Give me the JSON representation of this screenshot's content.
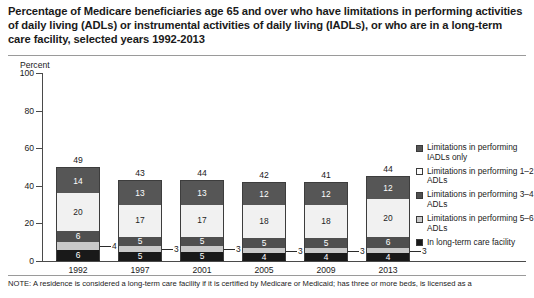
{
  "title": "Percentage of Medicare beneficiaries age 65 and over who have limitations in performing activities of daily living (ADLs) or instrumental activities of daily living (IADLs), or who are in a long-term care facility, selected years 1992-2013",
  "axis_title": "Percent",
  "note": "NOTE: A residence is considered a long-term care facility if it is certified by Medicare or Medicaid; has three or more beds, is licensed as a",
  "legend": {
    "items": [
      {
        "label": "Limitations in performing IADLs only",
        "swatch": "sw-iadl",
        "color": "#565656"
      },
      {
        "label": "Limitations in performing 1–2 ADLs",
        "swatch": "sw-adl12",
        "color": "#fbfbfb"
      },
      {
        "label": "Limitations in performing 3–4 ADLs",
        "swatch": "sw-adl34",
        "color": "#4f4f4f"
      },
      {
        "label": "Limitations in performing 5–6 ADLs",
        "swatch": "sw-adl56",
        "color": "#c9c9c9"
      },
      {
        "label": "In long-term care facility",
        "swatch": "sw-ltc",
        "color": "#191919"
      }
    ]
  },
  "chart_data": {
    "type": "bar",
    "subtype": "stacked-vertical",
    "title": "Percentage of Medicare beneficiaries age 65 and over who have limitations in performing activities of daily living (ADLs) or instrumental activities of daily living (IADLs), or who are in a long-term care facility, selected years 1992-2013",
    "xlabel": "",
    "ylabel": "Percent",
    "ylim": [
      0,
      100
    ],
    "yticks": [
      0,
      20,
      40,
      60,
      80,
      100
    ],
    "grid": false,
    "legend_position": "right",
    "categories": [
      "1992",
      "1997",
      "2001",
      "2005",
      "2009",
      "2013"
    ],
    "totals": [
      49,
      43,
      44,
      42,
      41,
      44
    ],
    "series": [
      {
        "name": "In long-term care facility",
        "color": "#191919",
        "values": [
          6,
          5,
          5,
          4,
          4,
          4
        ]
      },
      {
        "name": "Limitations in performing 5–6 ADLs",
        "color": "#c9c9c9",
        "values": [
          4,
          3,
          3,
          3,
          3,
          3
        ]
      },
      {
        "name": "Limitations in performing 3–4 ADLs",
        "color": "#4f4f4f",
        "values": [
          6,
          5,
          5,
          5,
          5,
          6
        ]
      },
      {
        "name": "Limitations in performing 1–2 ADLs",
        "color": "#f1f1f1",
        "values": [
          20,
          17,
          17,
          18,
          18,
          20
        ]
      },
      {
        "name": "Limitations in performing IADLs only",
        "color": "#565656",
        "values": [
          14,
          13,
          13,
          12,
          12,
          12
        ]
      }
    ]
  }
}
